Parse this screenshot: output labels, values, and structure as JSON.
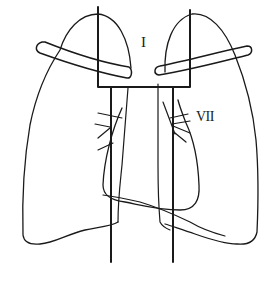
{
  "diagram": {
    "title": "",
    "type": "anatomical chest schematic with radiation field outline",
    "stroke_color": "#1a1a1a",
    "background": "#ffffff",
    "labels": {
      "upper_field": "I",
      "hilar_region": "VII"
    },
    "structures": [
      "left-lung-outline",
      "right-lung-outline",
      "heart-outline",
      "left-clavicle",
      "right-clavicle",
      "field-boundary-box",
      "mediastinal-field-lines",
      "hilar-vessel-lines"
    ]
  }
}
